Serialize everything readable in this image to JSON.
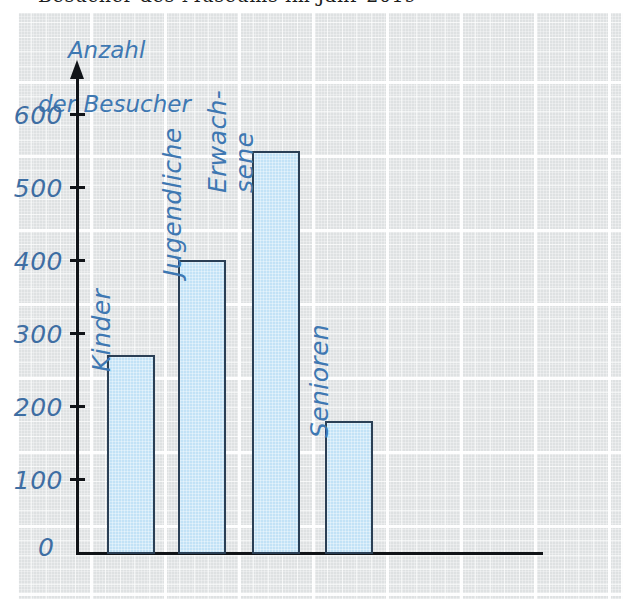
{
  "page": {
    "cut_off_text_top": "Besucher des Museums im Jahr 2019"
  },
  "chart": {
    "axis_title_line1": "Anzahl",
    "axis_title_line2": "der Besucher",
    "zero_label": "0",
    "y_tick_labels": [
      "600",
      "500",
      "400",
      "300",
      "200",
      "100"
    ],
    "colors": {
      "bar_fill": "#c2e2f6",
      "bar_stroke": "#2a3f55",
      "label_blue": "#3e78b2",
      "tick_label_blue": "#3e6ea3",
      "axis_black": "#111418",
      "paper_gray": "#d0d4d6",
      "grid_white": "#ffffff"
    },
    "bars": [
      {
        "label": "Kinder",
        "label_lines": [
          "Kinder"
        ],
        "value": 270
      },
      {
        "label": "Jugendliche",
        "label_lines": [
          "Jugendliche"
        ],
        "value": 400
      },
      {
        "label": "Erwachsene",
        "label_lines": [
          "Erwach-",
          "sene"
        ],
        "value": 550
      },
      {
        "label": "Senioren",
        "label_lines": [
          "Senioren"
        ],
        "value": 180
      }
    ]
  },
  "chart_data": {
    "type": "bar",
    "title": "Anzahl der Besucher",
    "categories": [
      "Kinder",
      "Jugendliche",
      "Erwachsene",
      "Senioren"
    ],
    "values": [
      270,
      400,
      550,
      180
    ],
    "xlabel": "",
    "ylabel": "Anzahl der Besucher",
    "ylim": [
      0,
      650
    ],
    "ytick_values": [
      0,
      100,
      200,
      300,
      400,
      500,
      600
    ],
    "ytick_labels": [
      "0",
      "100",
      "200",
      "300",
      "400",
      "500",
      "600"
    ],
    "grid": true,
    "legend": "none",
    "language": "de"
  }
}
